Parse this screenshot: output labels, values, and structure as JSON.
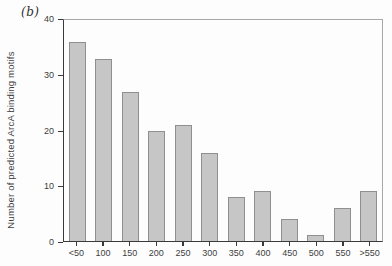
{
  "panel_label": "(b)",
  "chart_data": {
    "type": "bar",
    "title": "",
    "xlabel": "",
    "ylabel": "Number of predicted ArcA binding motifs",
    "categories": [
      "<50",
      "100",
      "150",
      "200",
      "250",
      "300",
      "350",
      "400",
      "450",
      "500",
      "550",
      ">550"
    ],
    "values": [
      36,
      33,
      27,
      20,
      21,
      16,
      8,
      9,
      4,
      1,
      6,
      9
    ],
    "ylim": [
      0,
      40
    ],
    "yticks": [
      0,
      10,
      20,
      30,
      40
    ],
    "grid": false,
    "legend": null,
    "colors": {
      "bar_fill": "#c6c6c6",
      "bar_border": "#8f8f8f",
      "axis_dark": "#3a3a3a",
      "axis_light": "#a8a8a8",
      "text": "#3d3d3d",
      "background": "#fdfdfd"
    }
  }
}
